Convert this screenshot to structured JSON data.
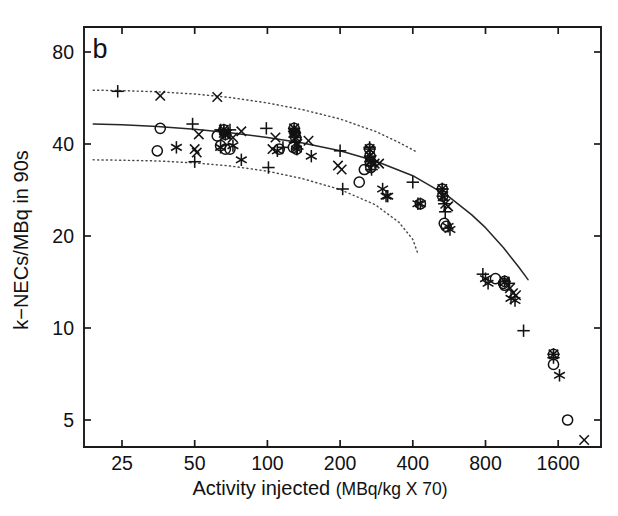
{
  "figure": {
    "panel_label": "b",
    "background_color": "#ffffff",
    "line_color": "#262626",
    "band_color": "#4a4a4a",
    "marker_color": "#121212"
  },
  "chart_data": {
    "type": "scatter",
    "title": "",
    "panel": "b",
    "xlabel": "Activity injected",
    "xlabel_units": "(MBq/kg X 70)",
    "ylabel": "k−NECs/MBq in 90s",
    "xscale": "log",
    "yscale": "log",
    "xlim": [
      18,
      2400
    ],
    "ylim": [
      3.8,
      105
    ],
    "grid": false,
    "legend": false,
    "xticks": [
      25,
      50,
      100,
      200,
      400,
      800,
      1600
    ],
    "xtick_labels": [
      "25",
      "50",
      "100",
      "200",
      "400",
      "800",
      "1600"
    ],
    "yticks": [
      5,
      10,
      20,
      40,
      80
    ],
    "ytick_labels": [
      "5",
      "10",
      "20",
      "40",
      "80"
    ],
    "series": [
      {
        "name": "plus",
        "marker": "+",
        "points": [
          [
            24,
            59.5
          ],
          [
            49,
            46.5
          ],
          [
            50,
            35.0
          ],
          [
            64,
            44.5
          ],
          [
            66,
            44.0
          ],
          [
            70,
            44.5
          ],
          [
            99,
            45.0
          ],
          [
            101,
            33.5
          ],
          [
            116,
            39.0
          ],
          [
            129,
            44.0
          ],
          [
            130,
            40.5
          ],
          [
            133,
            38.5
          ],
          [
            200,
            38.0
          ],
          [
            205,
            28.5
          ],
          [
            265,
            39.0
          ],
          [
            268,
            34.0
          ],
          [
            270,
            33.0
          ],
          [
            400,
            30.0
          ],
          [
            530,
            28.5
          ],
          [
            540,
            25.5
          ],
          [
            545,
            24.0
          ],
          [
            780,
            15.0
          ],
          [
            1000,
            14.0
          ],
          [
            1150,
            9.8
          ],
          [
            1530,
            8.0
          ]
        ]
      },
      {
        "name": "cross",
        "marker": "x",
        "points": [
          [
            36,
            57.5
          ],
          [
            50,
            38.5
          ],
          [
            51,
            37.5
          ],
          [
            52,
            43.0
          ],
          [
            62,
            57.0
          ],
          [
            66,
            43.5
          ],
          [
            68,
            43.0
          ],
          [
            72,
            42.0
          ],
          [
            78,
            44.0
          ],
          [
            105,
            38.5
          ],
          [
            108,
            42.0
          ],
          [
            128,
            43.5
          ],
          [
            130,
            41.5
          ],
          [
            133,
            40.0
          ],
          [
            148,
            41.0
          ],
          [
            196,
            34.0
          ],
          [
            203,
            33.0
          ],
          [
            270,
            35.5
          ],
          [
            278,
            34.5
          ],
          [
            290,
            34.5
          ],
          [
            535,
            27.0
          ],
          [
            545,
            25.5
          ],
          [
            560,
            25.0
          ],
          [
            1010,
            13.5
          ],
          [
            1040,
            13.0
          ],
          [
            1070,
            12.8
          ],
          [
            2050,
            4.3
          ]
        ]
      },
      {
        "name": "circle",
        "marker": "o",
        "points": [
          [
            36,
            45.0
          ],
          [
            35,
            38.0
          ],
          [
            62,
            42.5
          ],
          [
            64,
            39.5
          ],
          [
            67,
            38.5
          ],
          [
            70,
            38.5
          ],
          [
            112,
            38.5
          ],
          [
            128,
            39.0
          ],
          [
            132,
            38.5
          ],
          [
            240,
            30.0
          ],
          [
            252,
            33.0
          ],
          [
            268,
            33.5
          ],
          [
            430,
            25.5
          ],
          [
            540,
            22.0
          ],
          [
            550,
            21.5
          ],
          [
            880,
            14.5
          ],
          [
            950,
            14.0
          ],
          [
            960,
            13.8
          ],
          [
            1530,
            7.6
          ],
          [
            1750,
            5.0
          ]
        ]
      },
      {
        "name": "asterisk",
        "marker": "*",
        "points": [
          [
            42,
            39.0
          ],
          [
            64,
            39.0
          ],
          [
            72,
            39.5
          ],
          [
            78,
            35.5
          ],
          [
            110,
            38.0
          ],
          [
            132,
            38.5
          ],
          [
            152,
            36.5
          ],
          [
            300,
            28.5
          ],
          [
            310,
            27.0
          ],
          [
            315,
            27.0
          ],
          [
            420,
            25.5
          ],
          [
            430,
            25.5
          ],
          [
            560,
            21.5
          ],
          [
            570,
            21.0
          ],
          [
            800,
            14.5
          ],
          [
            820,
            14.0
          ],
          [
            1020,
            12.5
          ],
          [
            1060,
            12.3
          ],
          [
            1620,
            7.0
          ]
        ]
      },
      {
        "name": "overlapping-cluster",
        "marker": "composite",
        "points": [
          [
            66,
            44.5
          ],
          [
            67,
            43.0
          ],
          [
            129,
            45.0
          ],
          [
            130,
            43.5
          ],
          [
            131,
            42.0
          ],
          [
            265,
            38.5
          ],
          [
            266,
            36.5
          ],
          [
            267,
            35.0
          ],
          [
            530,
            28.5
          ],
          [
            532,
            27.0
          ],
          [
            960,
            14.2
          ],
          [
            1530,
            8.2
          ]
        ]
      }
    ],
    "fit_curve": {
      "name": "fitted-regression",
      "style": "solid",
      "points": [
        [
          19,
          46.5
        ],
        [
          25,
          46.2
        ],
        [
          35,
          45.6
        ],
        [
          50,
          44.7
        ],
        [
          70,
          43.5
        ],
        [
          100,
          42.0
        ],
        [
          140,
          40.3
        ],
        [
          200,
          38.0
        ],
        [
          280,
          35.2
        ],
        [
          400,
          31.5
        ],
        [
          560,
          27.0
        ],
        [
          700,
          23.5
        ],
        [
          800,
          21.3
        ],
        [
          950,
          18.3
        ],
        [
          1100,
          15.8
        ],
        [
          1200,
          14.4
        ]
      ]
    },
    "confidence_bands": [
      {
        "name": "upper-confidence-band",
        "style": "dotted",
        "points": [
          [
            19,
            60.0
          ],
          [
            25,
            59.8
          ],
          [
            35,
            59.3
          ],
          [
            50,
            58.3
          ],
          [
            70,
            56.8
          ],
          [
            100,
            54.5
          ],
          [
            140,
            51.8
          ],
          [
            200,
            48.3
          ],
          [
            280,
            44.0
          ],
          [
            350,
            40.5
          ],
          [
            420,
            37.5
          ]
        ]
      },
      {
        "name": "lower-confidence-band",
        "style": "dotted",
        "points": [
          [
            19,
            35.5
          ],
          [
            25,
            35.4
          ],
          [
            35,
            35.2
          ],
          [
            50,
            34.7
          ],
          [
            70,
            33.9
          ],
          [
            100,
            32.6
          ],
          [
            140,
            30.8
          ],
          [
            200,
            28.4
          ],
          [
            280,
            25.3
          ],
          [
            350,
            22.2
          ],
          [
            400,
            19.5
          ],
          [
            420,
            17.5
          ]
        ]
      }
    ]
  }
}
